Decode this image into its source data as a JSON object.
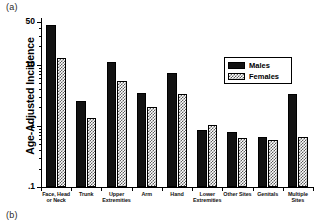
{
  "figure": {
    "panel_a_letter": "(a)",
    "panel_b_letter": "(b)",
    "y_axis_title": "Age-Adjusted Incidence"
  },
  "legend": {
    "position": "inside-upper-right",
    "entries": [
      {
        "label": "Males",
        "pattern": "solid-black",
        "color": "#121212"
      },
      {
        "label": "Females",
        "pattern": "checkered-gray",
        "color": "#5d5d5d"
      }
    ]
  },
  "chart_data": {
    "type": "bar",
    "title": "",
    "xlabel": "",
    "ylabel": "Age-Adjusted Incidence",
    "yscale": "log",
    "ylim": [
      0.1,
      60
    ],
    "ytick_labels": [
      "50",
      "10",
      "1",
      ".1"
    ],
    "ytick_values": [
      50,
      10,
      1,
      0.1
    ],
    "grid": false,
    "categories": [
      "Face, Head or Neck",
      "Trunk",
      "Upper Extremities",
      "Arm",
      "Hand",
      "Lower Extremities",
      "Other Sites",
      "Genitals",
      "Multiple Sites"
    ],
    "series": [
      {
        "name": "Males",
        "values": [
          44,
          2.6,
          11.0,
          3.4,
          7.3,
          0.87,
          0.8,
          0.67,
          3.3
        ]
      },
      {
        "name": "Females",
        "values": [
          13,
          1.35,
          5.5,
          2.0,
          3.3,
          1.05,
          0.63,
          0.58,
          0.67
        ]
      }
    ]
  }
}
